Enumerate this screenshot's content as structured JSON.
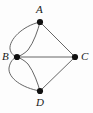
{
  "figure": {
    "background_color": "#fdfdfd",
    "stroke_color": "#555555",
    "vertex_color": "#111111",
    "label_color": "#1a1a1a",
    "width": 93,
    "height": 113
  },
  "vertices": [
    {
      "id": "A",
      "label": "A",
      "x": 40,
      "y": 22,
      "label_x": 36,
      "label_y": 4,
      "label_position": "above"
    },
    {
      "id": "B",
      "label": "B",
      "x": 17,
      "y": 57,
      "label_x": 2,
      "label_y": 51,
      "label_position": "left"
    },
    {
      "id": "C",
      "label": "C",
      "x": 75,
      "y": 57,
      "label_x": 81,
      "label_y": 51,
      "label_position": "right"
    },
    {
      "id": "D",
      "label": "D",
      "x": 40,
      "y": 91,
      "label_x": 36,
      "label_y": 97,
      "label_position": "below"
    }
  ],
  "edges": [
    {
      "id": "AB-outer",
      "from": "A",
      "to": "B",
      "style": "curved",
      "bulge": "left",
      "multiplicity_index": 1
    },
    {
      "id": "AB-inner",
      "from": "A",
      "to": "B",
      "style": "curved",
      "bulge": "right",
      "multiplicity_index": 2
    },
    {
      "id": "BD-outer",
      "from": "B",
      "to": "D",
      "style": "curved",
      "bulge": "left",
      "multiplicity_index": 1
    },
    {
      "id": "BD-inner",
      "from": "B",
      "to": "D",
      "style": "curved",
      "bulge": "right",
      "multiplicity_index": 2
    },
    {
      "id": "AC",
      "from": "A",
      "to": "C",
      "style": "straight",
      "multiplicity_index": 1
    },
    {
      "id": "BC",
      "from": "B",
      "to": "C",
      "style": "straight",
      "multiplicity_index": 1
    },
    {
      "id": "DC",
      "from": "D",
      "to": "C",
      "style": "straight",
      "multiplicity_index": 1
    }
  ],
  "paths": {
    "AB-outer": "M 40 22 C 22 26 9 40 10 49 C 11 54 14 56 17 57",
    "AB-inner": "M 40 22 C 38 30 34 42 28 50 C 24 54 20 56 17 57",
    "BD-outer": "M 17 57 C 13 58 10 62 9 68 C 8 78 22 88 40 91",
    "BD-inner": "M 17 57 C 20 58 24 60 28 64 C 34 72 38 84 40 91",
    "AC": "M 40 22 L 75 57",
    "BC": "M 17 57 L 75 57",
    "DC": "M 40 91 L 75 57"
  },
  "vertex_radius": 3.1,
  "edge_stroke_width": 0.9
}
